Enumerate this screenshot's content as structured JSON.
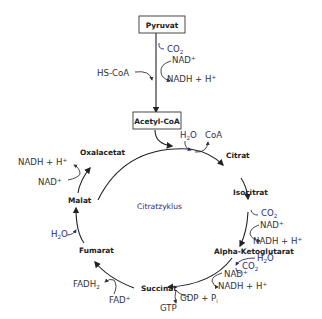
{
  "diagram": {
    "title": "Citratzyklus",
    "colors": {
      "text": "#222222",
      "accent_blue": "#2e2a7a",
      "lines": "#222222"
    },
    "entry": {
      "pyruvat": "Pyruvat",
      "acetyl_coa": "Acetyl-CoA",
      "co2": "CO",
      "co2_sub": "2",
      "nad": "NAD",
      "nad_sup": "+",
      "nadh": "NADH + H",
      "nadh_sup": "+",
      "hscoa": "HS-CoA"
    },
    "metabolites": {
      "citrat": "Citrat",
      "isocitrat": "Isocitrat",
      "alpha_ketoglutarat": "Alpha-Ketoglutarat",
      "succinat": "Succinat",
      "fumarat": "Fumarat",
      "malat": "Malat",
      "oxalacetat": "Oxalacetat"
    },
    "cofactors": {
      "citrat_h2o": "H",
      "citrat_h2o_sub": "2",
      "citrat_h2o_end": "O",
      "citrat_coa": "CoA",
      "iso_co2": "CO",
      "iso_co2_sub": "2",
      "iso_nad": "NAD",
      "iso_nad_sup": "+",
      "iso_nadh": "NADH + H",
      "iso_nadh_sup": "+",
      "akg_h2o": "H",
      "akg_h2o_sub": "2",
      "akg_h2o_end": "O",
      "akg_co2": "CO",
      "akg_co2_sub": "2",
      "akg_nad": "NAD",
      "akg_nad_sup": "+",
      "akg_nadh": "NADH + H",
      "akg_nadh_sup": "+",
      "gdp": "GDP + P",
      "gdp_sub": "i",
      "gtp": "GTP",
      "fadh2": "FADH",
      "fadh2_sub": "2",
      "fad": "FAD",
      "fad_sup": "+",
      "fum_h2o": "H",
      "fum_h2o_sub": "2",
      "fum_h2o_end": "O",
      "mal_nad": "NAD",
      "mal_nad_sup": "+",
      "mal_nadh": "NADH + H",
      "mal_nadh_sup": "+"
    }
  }
}
